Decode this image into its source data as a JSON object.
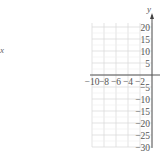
{
  "left_fragment": "x",
  "chart_data": {
    "type": "line",
    "title": "",
    "xlabel": "",
    "ylabel": "y",
    "xlim": [
      -10,
      0
    ],
    "ylim": [
      -30,
      20
    ],
    "grid": true,
    "x_ticks": [
      -10,
      -8,
      -6,
      -4,
      -2
    ],
    "x_tick_labels": [
      "−10",
      "−8",
      "−6",
      "−4",
      "−2"
    ],
    "y_ticks": [
      20,
      15,
      10,
      5,
      -5,
      -10,
      -15,
      -20,
      -25,
      -30
    ],
    "y_tick_labels": [
      "20",
      "15",
      "10",
      "5",
      "−5",
      "−10",
      "−15",
      "−20",
      "−25",
      "−30"
    ],
    "series": []
  }
}
